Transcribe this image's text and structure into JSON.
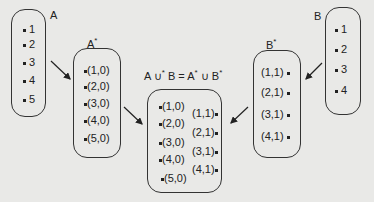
{
  "diagram": {
    "setA": {
      "label": "A",
      "items": [
        "1",
        "2",
        "3",
        "4",
        "5"
      ]
    },
    "setAstar": {
      "label": "A",
      "sup": "*",
      "items": [
        "(1,0)",
        "(2,0)",
        "(3,0)",
        "(4,0)",
        "(5,0)"
      ]
    },
    "setB": {
      "label": "B",
      "items": [
        "1",
        "2",
        "3",
        "4"
      ]
    },
    "setBstar": {
      "label": "B",
      "sup": "*",
      "items": [
        "(1,1)",
        "(2,1)",
        "(3,1)",
        "(4,1)"
      ]
    },
    "union": {
      "label_parts": [
        "A ∪",
        "*",
        " B = A",
        "*",
        " ∪ B",
        "*"
      ],
      "left_items": [
        "(1,0)",
        "(2,0)",
        "(3,0)",
        "(4,0)",
        "(5,0)"
      ],
      "right_items": [
        "(1,1)",
        "(2,1)",
        "(3,1)",
        "(4,1)"
      ]
    }
  }
}
